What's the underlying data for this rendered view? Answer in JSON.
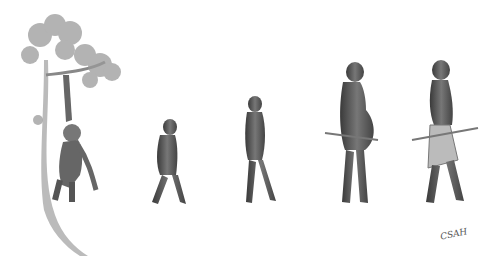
{
  "illustration": {
    "subject": "evolution sequence of hominids",
    "style": "grayscale pencil drawing",
    "background": "#ffffff",
    "figures": [
      {
        "id": "ape-in-tree",
        "description": "ape hanging from tree branch",
        "x": 20,
        "y": 15,
        "w": 105,
        "h": 240
      },
      {
        "id": "small-hominid",
        "description": "small walking hominid",
        "x": 148,
        "y": 120,
        "w": 45,
        "h": 88
      },
      {
        "id": "early-human",
        "description": "walking early human with arms folded",
        "x": 240,
        "y": 95,
        "w": 45,
        "h": 112
      },
      {
        "id": "pregnant-human",
        "description": "standing pregnant human with stick",
        "x": 325,
        "y": 62,
        "w": 65,
        "h": 145
      },
      {
        "id": "modern-human",
        "description": "walking woman with skirt and stick",
        "x": 412,
        "y": 60,
        "w": 60,
        "h": 148
      }
    ],
    "signature": "CSAH"
  }
}
